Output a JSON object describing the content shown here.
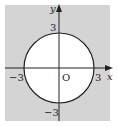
{
  "diagram": {
    "title": "",
    "colors": {
      "background": "#ffffff",
      "shaded_region": "#d4d4d4",
      "circle_interior": "#ffffff",
      "stroke": "#222222"
    },
    "axes": {
      "x_label": "x",
      "y_label": "y",
      "origin_label": "O"
    },
    "ticks": {
      "x_neg": "−3",
      "x_pos": "3",
      "y_pos": "3",
      "y_neg": "−3"
    },
    "circle": {
      "center": [
        0,
        0
      ],
      "radius": 3
    }
  }
}
